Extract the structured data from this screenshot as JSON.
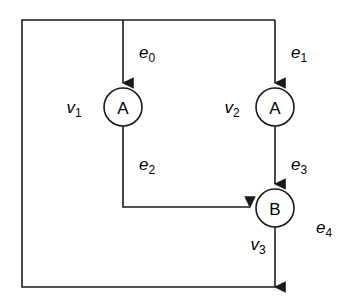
{
  "diagram": {
    "background_color": "#ffffff",
    "line_color": "#1a1a1a",
    "nodes": [
      {
        "id": "v1",
        "label": "A",
        "vertex_name": "v",
        "vertex_sub": "1",
        "cx": 123,
        "cy": 107,
        "r": 19
      },
      {
        "id": "v2",
        "label": "A",
        "vertex_name": "v",
        "vertex_sub": "2",
        "cx": 275,
        "cy": 107,
        "r": 19
      },
      {
        "id": "v3",
        "label": "B",
        "vertex_name": "v",
        "vertex_sub": "3",
        "cx": 275,
        "cy": 208,
        "r": 19
      }
    ],
    "edges": [
      {
        "id": "e0",
        "name": "e",
        "sub": "0",
        "from": "source-top",
        "to": "v1",
        "label_x": 147,
        "label_y": 58
      },
      {
        "id": "e1",
        "name": "e",
        "sub": "1",
        "from": "source-top",
        "to": "v2",
        "label_x": 299,
        "label_y": 58
      },
      {
        "id": "e2",
        "name": "e",
        "sub": "2",
        "from": "v1",
        "to": "v3",
        "label_x": 147,
        "label_y": 170
      },
      {
        "id": "e3",
        "name": "e",
        "sub": "3",
        "from": "v2",
        "to": "v3",
        "label_x": 299,
        "label_y": 170
      },
      {
        "id": "e4",
        "name": "e",
        "sub": "4",
        "from": "v3",
        "to": "sink-bottom",
        "label_x": 324,
        "label_y": 233
      }
    ],
    "vertex_labels": [
      {
        "id": "v1-label",
        "name": "v",
        "sub": "1",
        "x": 74,
        "y": 113
      },
      {
        "id": "v2-label",
        "name": "v",
        "sub": "2",
        "x": 232,
        "y": 113
      },
      {
        "id": "v3-label",
        "name": "v",
        "sub": "3",
        "x": 258,
        "y": 250
      }
    ],
    "frame": {
      "left_x": 22,
      "top_y": 20,
      "bottom_y": 287,
      "right_x": 275
    }
  }
}
